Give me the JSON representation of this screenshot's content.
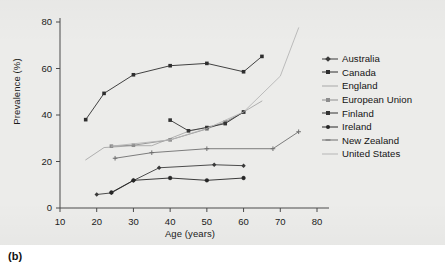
{
  "figure": {
    "caption": "(b)",
    "panel_bg": "#ececea"
  },
  "legend": {
    "position": "right",
    "entries": [
      {
        "label": "Australia",
        "color": "#3a3a3a",
        "marker": "diamond"
      },
      {
        "label": "Canada",
        "color": "#2e2e2e",
        "marker": "square"
      },
      {
        "label": "England",
        "color": "#a8a8a8",
        "marker": "none"
      },
      {
        "label": "European Union",
        "color": "#8d8d8d",
        "marker": "square"
      },
      {
        "label": "Finland",
        "color": "#333333",
        "marker": "square"
      },
      {
        "label": "Ireland",
        "color": "#262626",
        "marker": "circle"
      },
      {
        "label": "New Zealand",
        "color": "#6f6f6f",
        "marker": "plus"
      },
      {
        "label": "United States",
        "color": "#b5b5b5",
        "marker": "none"
      }
    ]
  },
  "chart_data": {
    "type": "line",
    "title": "",
    "xlabel": "Age (years)",
    "ylabel": "Prevalence (%)",
    "xlim": [
      10,
      80
    ],
    "ylim": [
      0,
      80
    ],
    "xticks": [
      10,
      20,
      30,
      40,
      50,
      60,
      70,
      80
    ],
    "yticks": [
      0,
      20,
      40,
      60,
      80
    ],
    "grid": false,
    "series": [
      {
        "name": "Australia",
        "color": "#3a3a3a",
        "marker": "diamond",
        "points": [
          [
            20,
            5.8
          ],
          [
            24,
            6.5
          ],
          [
            30,
            11.8
          ],
          [
            37,
            17.3
          ],
          [
            52,
            18.6
          ],
          [
            60,
            18.2
          ]
        ]
      },
      {
        "name": "Canada",
        "color": "#2e2e2e",
        "marker": "square",
        "points": [
          [
            17,
            38.0
          ],
          [
            22,
            49.3
          ],
          [
            30,
            57.3
          ],
          [
            40,
            61.2
          ],
          [
            50,
            62.2
          ],
          [
            60,
            58.6
          ],
          [
            65,
            65.2
          ]
        ]
      },
      {
        "name": "England",
        "color": "#a8a8a8",
        "marker": "none",
        "points": [
          [
            17,
            20.7
          ],
          [
            22,
            26.0
          ],
          [
            30,
            26.8
          ],
          [
            35,
            26.8
          ],
          [
            45,
            33.0
          ],
          [
            55,
            36.6
          ],
          [
            65,
            46.0
          ]
        ]
      },
      {
        "name": "European Union",
        "color": "#8d8d8d",
        "marker": "square",
        "points": [
          [
            24,
            26.6
          ],
          [
            30,
            27.0
          ],
          [
            40,
            29.3
          ],
          [
            50,
            34.0
          ],
          [
            55,
            37.0
          ],
          [
            60,
            41.2
          ]
        ]
      },
      {
        "name": "Finland",
        "color": "#333333",
        "marker": "square",
        "points": [
          [
            40,
            37.8
          ],
          [
            45,
            33.2
          ],
          [
            50,
            34.6
          ],
          [
            55,
            36.3
          ],
          [
            60,
            41.3
          ]
        ]
      },
      {
        "name": "Ireland",
        "color": "#262626",
        "marker": "circle",
        "points": [
          [
            24,
            6.7
          ],
          [
            30,
            11.9
          ],
          [
            40,
            12.9
          ],
          [
            50,
            11.9
          ],
          [
            60,
            12.9
          ]
        ]
      },
      {
        "name": "New Zealand",
        "color": "#6f6f6f",
        "marker": "plus",
        "points": [
          [
            25,
            21.4
          ],
          [
            35,
            23.8
          ],
          [
            50,
            25.5
          ],
          [
            68,
            25.5
          ],
          [
            75,
            32.8
          ]
        ]
      },
      {
        "name": "United States",
        "color": "#b5b5b5",
        "marker": "none",
        "points": [
          [
            24,
            26.6
          ],
          [
            40,
            29.3
          ],
          [
            50,
            34.2
          ],
          [
            60,
            41.3
          ],
          [
            70,
            56.7
          ],
          [
            75,
            77.5
          ]
        ]
      }
    ]
  }
}
